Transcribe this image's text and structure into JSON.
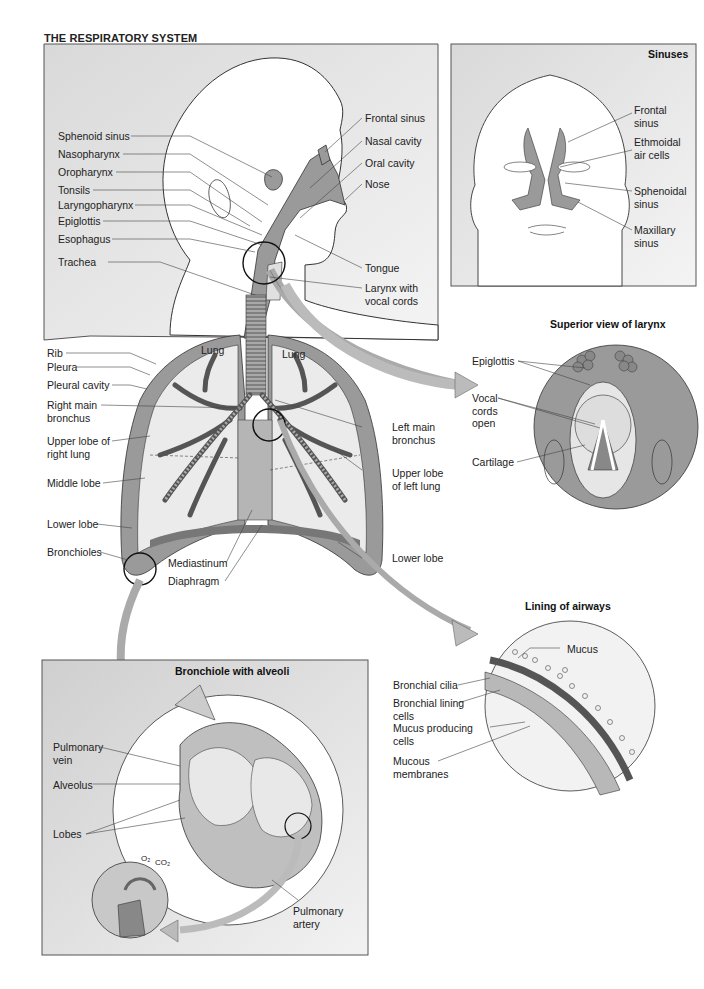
{
  "title": "THE RESPIRATORY SYSTEM",
  "head_panel": {
    "left_labels": [
      "Sphenoid sinus",
      "Nasopharynx",
      "Oropharynx",
      "Tonsils",
      "Laryngopharynx",
      "Epiglottis",
      "Esophagus",
      "Trachea"
    ],
    "right_labels": [
      "Frontal sinus",
      "Nasal cavity",
      "Oral cavity",
      "Nose",
      "Tongue",
      "Larynx with\nvocal cords"
    ]
  },
  "sinuses_panel": {
    "heading": "Sinuses",
    "labels": [
      "Frontal\nsinus",
      "Ethmoidal\nair cells",
      "Sphenoidal\nsinus",
      "Maxillary\nsinus"
    ]
  },
  "lungs": {
    "lung_labels": [
      "Lung",
      "Lung"
    ],
    "left_labels": [
      "Rib",
      "Pleura",
      "Pleural cavity",
      "Right main\nbronchus",
      "Upper lobe of\nright lung",
      "Middle lobe",
      "Lower lobe",
      "Bronchioles"
    ],
    "bottom_labels": [
      "Mediastinum",
      "Diaphragm"
    ],
    "right_labels": [
      "Left main\nbronchus",
      "Upper lobe\nof left lung",
      "Lower lobe"
    ]
  },
  "larynx_panel": {
    "heading": "Superior view of larynx",
    "labels": [
      "Epiglottis",
      "Vocal\ncords\nopen",
      "Cartilage"
    ]
  },
  "airways_panel": {
    "heading": "Lining of airways",
    "labels": [
      "Mucus",
      "Bronchial cilia",
      "Bronchial lining\ncells",
      "Mucus producing\ncells",
      "Mucous\nmembranes"
    ]
  },
  "alveoli_panel": {
    "heading": "Bronchiole with alveoli",
    "labels": [
      "Pulmonary\nvein",
      "Alveolus",
      "Lobes",
      "Pulmonary\nartery"
    ],
    "gas_labels": [
      "O₂",
      "CO₂"
    ]
  },
  "colors": {
    "panel_gray": "#e4e4e4",
    "organ_gray": "#9a9a9a",
    "light_gray": "#d8d8d8",
    "line": "#333333"
  }
}
